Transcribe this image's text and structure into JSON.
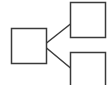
{
  "diagram": {
    "type": "tree-icon",
    "stroke_color": "#3a3a3a",
    "background": "#ffffff",
    "nodes": [
      {
        "id": "root",
        "x": 11.5,
        "y": 28.5,
        "w": 35,
        "h": 35
      },
      {
        "id": "child-top",
        "x": 70.5,
        "y": 2.5,
        "w": 35,
        "h": 35
      },
      {
        "id": "child-bottom",
        "x": 70.5,
        "y": 52.5,
        "w": 35,
        "h": 40
      }
    ],
    "edges": [
      {
        "from": "root",
        "to": "child-top",
        "x1": 46.5,
        "y1": 43,
        "x2": 70.5,
        "y2": 24
      },
      {
        "from": "root",
        "to": "child-bottom",
        "x1": 46.5,
        "y1": 48,
        "x2": 70.5,
        "y2": 68
      }
    ]
  }
}
